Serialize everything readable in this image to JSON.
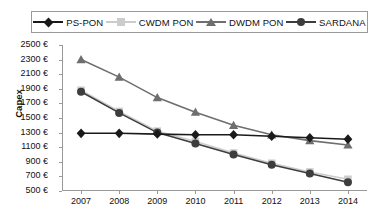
{
  "legend": {
    "position": "top",
    "items": [
      {
        "label": "PS-PON",
        "marker": "diamond",
        "color": "#1a1a1a",
        "line_color": "#1a1a1a",
        "icon": "diamond-marker-icon"
      },
      {
        "label": "CWDM PON",
        "marker": "square",
        "color": "#cccccc",
        "line_color": "#cccccc",
        "icon": "square-marker-icon"
      },
      {
        "label": "DWDM PON",
        "marker": "triangle",
        "color": "#6e6e6e",
        "line_color": "#6e6e6e",
        "icon": "triangle-marker-icon"
      },
      {
        "label": "SARDANA",
        "marker": "circle",
        "color": "#3d3d3d",
        "line_color": "#3d3d3d",
        "icon": "circle-marker-icon"
      }
    ]
  },
  "axes": {
    "ylabel": "Capex",
    "xlabel": "",
    "yticks": [
      "2500 €",
      "2300 €",
      "2100 €",
      "1900 €",
      "1700 €",
      "1500 €",
      "1300 €",
      "1100 €",
      "900 €",
      "700 €",
      "500 €"
    ],
    "xticks": [
      "2007",
      "2008",
      "2009",
      "2010",
      "2011",
      "2012",
      "2013",
      "2014"
    ]
  },
  "chart_data": {
    "type": "line",
    "title": "",
    "xlabel": "",
    "ylabel": "Capex",
    "categories": [
      "2007",
      "2008",
      "2009",
      "2010",
      "2011",
      "2012",
      "2013",
      "2014"
    ],
    "x": [
      2007,
      2008,
      2009,
      2010,
      2011,
      2012,
      2013,
      2014
    ],
    "ylim": [
      500,
      2500
    ],
    "ytick_step": 200,
    "yunit": "€",
    "grid": false,
    "legend_position": "top",
    "series": [
      {
        "name": "PS-PON",
        "marker": "diamond",
        "color": "#1a1a1a",
        "values": [
          1290,
          1290,
          1280,
          1270,
          1270,
          1250,
          1230,
          1210
        ]
      },
      {
        "name": "CWDM PON",
        "marker": "square",
        "color": "#cccccc",
        "values": [
          1880,
          1590,
          1320,
          1180,
          1020,
          880,
          760,
          660
        ]
      },
      {
        "name": "DWDM PON",
        "marker": "triangle",
        "color": "#6e6e6e",
        "values": [
          2300,
          2060,
          1780,
          1580,
          1400,
          1270,
          1190,
          1130
        ]
      },
      {
        "name": "SARDANA",
        "marker": "circle",
        "color": "#3d3d3d",
        "values": [
          1860,
          1570,
          1300,
          1150,
          1000,
          860,
          740,
          620
        ]
      }
    ]
  }
}
